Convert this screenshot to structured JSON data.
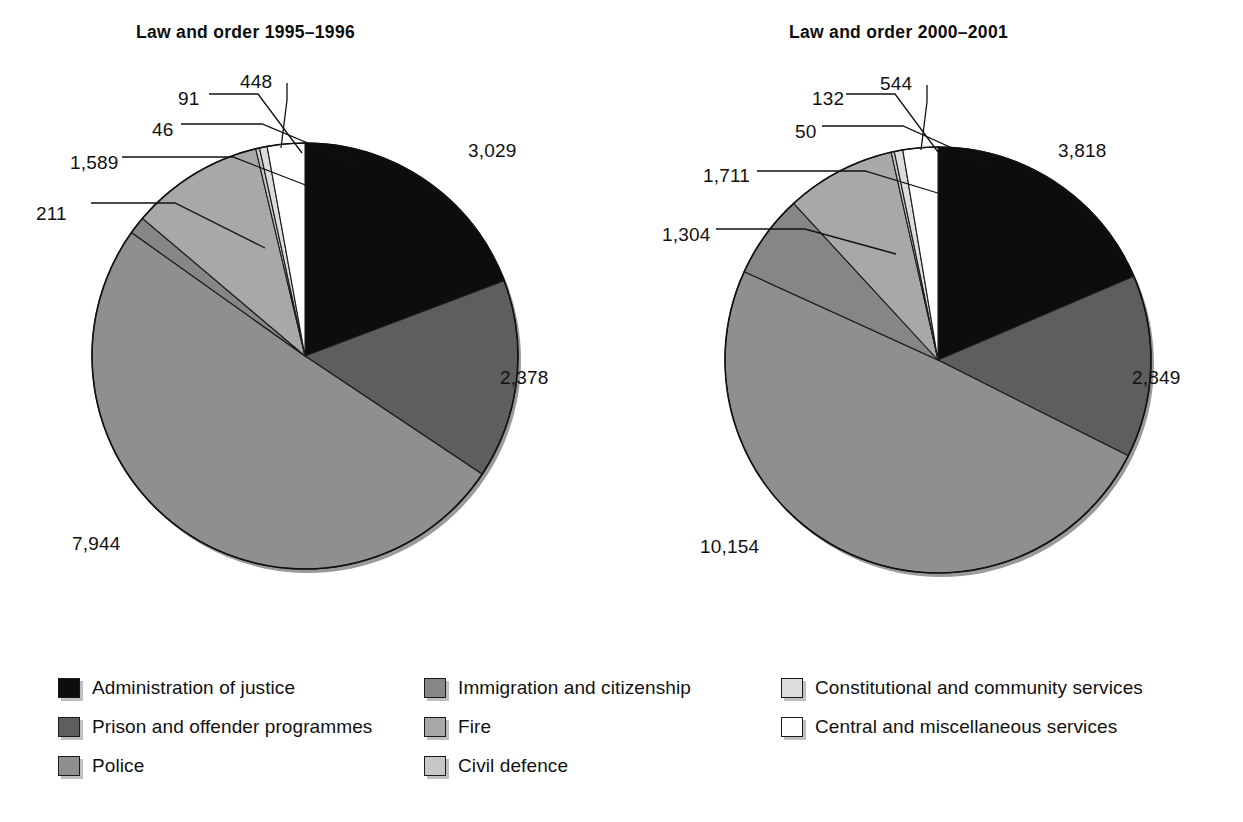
{
  "figure": {
    "background": "#ffffff"
  },
  "charts": [
    {
      "id": "left",
      "title": "Law and order 1995–1996",
      "center": {
        "x": 305,
        "y": 356
      },
      "radius": 213,
      "labels": [
        {
          "text": "3,029",
          "x": 468,
          "y": 140
        },
        {
          "text": "2,378",
          "x": 500,
          "y": 367
        },
        {
          "text": "7,944",
          "x": 72,
          "y": 533
        },
        {
          "text": "211",
          "x": 36,
          "y": 203
        },
        {
          "text": "1,589",
          "x": 70,
          "y": 152
        },
        {
          "text": "46",
          "x": 152,
          "y": 119
        },
        {
          "text": "91",
          "x": 178,
          "y": 88
        },
        {
          "text": "448",
          "x": 240,
          "y": 71
        }
      ]
    },
    {
      "id": "right",
      "title": "Law and order 2000–2001",
      "center": {
        "x": 938,
        "y": 360
      },
      "radius": 213,
      "labels": [
        {
          "text": "3,818",
          "x": 1058,
          "y": 140
        },
        {
          "text": "2,849",
          "x": 1132,
          "y": 367
        },
        {
          "text": "10,154",
          "x": 700,
          "y": 536
        },
        {
          "text": "1,304",
          "x": 662,
          "y": 224
        },
        {
          "text": "1,711",
          "x": 703,
          "y": 165
        },
        {
          "text": "50",
          "x": 795,
          "y": 121
        },
        {
          "text": "132",
          "x": 812,
          "y": 88
        },
        {
          "text": "544",
          "x": 880,
          "y": 73
        }
      ]
    }
  ],
  "legend": {
    "columns": [
      [
        {
          "label": "Administration of justice",
          "color": "#0d0d0d"
        },
        {
          "label": "Prison and offender programmes",
          "color": "#5e5e5e"
        },
        {
          "label": "Police",
          "color": "#8f8f8f"
        }
      ],
      [
        {
          "label": "Immigration and citizenship",
          "color": "#868686"
        },
        {
          "label": "Fire",
          "color": "#a8a8a8"
        },
        {
          "label": "Civil defence",
          "color": "#c7c7c7"
        }
      ],
      [
        {
          "label": "Constitutional and community services",
          "color": "#dcdcdc"
        },
        {
          "label": "Central and miscellaneous services",
          "color": "#ffffff"
        }
      ]
    ]
  },
  "chart_data": [
    {
      "type": "pie",
      "title": "Law and order 1995–1996",
      "categories": [
        "Administration of justice",
        "Prison and offender programmes",
        "Police",
        "Immigration and citizenship",
        "Fire",
        "Civil defence",
        "Constitutional and community services",
        "Central and miscellaneous services"
      ],
      "values": [
        3029,
        2378,
        7944,
        211,
        1589,
        46,
        91,
        448
      ],
      "labels": [
        "3,029",
        "2,378",
        "7,944",
        "211",
        "1,589",
        "46",
        "91",
        "448"
      ],
      "colors": [
        "#0d0d0d",
        "#5e5e5e",
        "#8f8f8f",
        "#868686",
        "#a8a8a8",
        "#c7c7c7",
        "#dcdcdc",
        "#ffffff"
      ],
      "total": 15736,
      "start_angle_deg": 0,
      "direction": "clockwise",
      "legend_position": "bottom",
      "grid": false
    },
    {
      "type": "pie",
      "title": "Law and order 2000–2001",
      "categories": [
        "Administration of justice",
        "Prison and offender programmes",
        "Police",
        "Immigration and citizenship",
        "Fire",
        "Civil defence",
        "Constitutional and community services",
        "Central and miscellaneous services"
      ],
      "values": [
        3818,
        2849,
        10154,
        1304,
        1711,
        50,
        132,
        544
      ],
      "labels": [
        "3,818",
        "2,849",
        "10,154",
        "1,304",
        "1,711",
        "50",
        "132",
        "544"
      ],
      "colors": [
        "#0d0d0d",
        "#5e5e5e",
        "#8f8f8f",
        "#868686",
        "#a8a8a8",
        "#c7c7c7",
        "#dcdcdc",
        "#ffffff"
      ],
      "total": 20562,
      "start_angle_deg": 0,
      "direction": "clockwise",
      "legend_position": "bottom",
      "grid": false
    }
  ]
}
